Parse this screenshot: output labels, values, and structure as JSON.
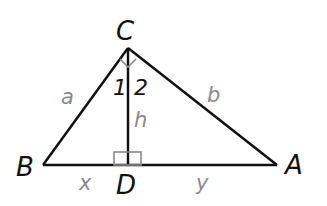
{
  "diagram": {
    "type": "right triangle with altitude",
    "vertices": {
      "C": {
        "label": "C",
        "x": 128,
        "y": 48
      },
      "B": {
        "label": "B",
        "x": 43,
        "y": 165
      },
      "A": {
        "label": "A",
        "x": 277,
        "y": 165
      },
      "D": {
        "label": "D",
        "x": 128,
        "y": 165
      }
    },
    "sides": {
      "a": "a",
      "b": "b",
      "h": "h",
      "x": "x",
      "y": "y"
    },
    "angles": {
      "angle1": "1",
      "angle2": "2"
    },
    "colors": {
      "line": "#111111",
      "label_gray": "#8a8a8a",
      "arc_gray": "#8a8a8a"
    }
  }
}
